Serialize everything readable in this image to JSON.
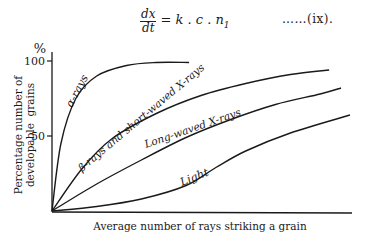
{
  "equation": {
    "numerator": "dx",
    "denominator": "dt",
    "rhs": "= k . c . n",
    "rhs_subscript": "1",
    "number": "……(ix)."
  },
  "chart_data": {
    "type": "line",
    "title": "",
    "xlabel": "Average number of rays striking a grain",
    "ylabel_line1": "Percentage number of",
    "ylabel_line2": "developable  grains",
    "y_unit": "%",
    "yticks": [
      50,
      100
    ],
    "ytick_labels": [
      "50",
      "100"
    ],
    "ylim": [
      0,
      100
    ],
    "xlim": [
      0,
      100
    ],
    "x_ticks": [],
    "grid": false,
    "legend": "inline labels on curves",
    "series": [
      {
        "name": "α-rays",
        "x": [
          0,
          3,
          8,
          15,
          25,
          35,
          46
        ],
        "values": [
          0,
          45,
          75,
          90,
          97,
          99,
          99
        ]
      },
      {
        "name": "β-rays and short-waved X-rays",
        "x": [
          0,
          10,
          20,
          35,
          50,
          65,
          80,
          93
        ],
        "values": [
          0,
          28,
          48,
          65,
          77,
          85,
          91,
          94
        ]
      },
      {
        "name": "Long-waved X-rays",
        "x": [
          0,
          15,
          30,
          45,
          60,
          75,
          90,
          97
        ],
        "values": [
          0,
          18,
          34,
          49,
          61,
          71,
          78,
          82
        ]
      },
      {
        "name": "Light",
        "x": [
          0,
          15,
          30,
          45,
          55,
          65,
          80,
          100
        ],
        "values": [
          0,
          3,
          8,
          17,
          29,
          40,
          52,
          64
        ]
      }
    ]
  }
}
